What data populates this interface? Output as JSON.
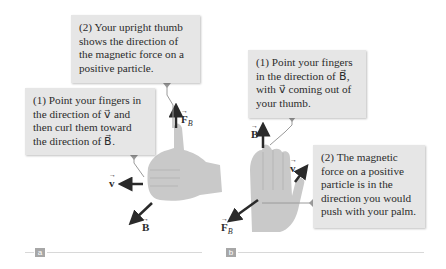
{
  "panel_a": {
    "label": "a",
    "callout_1": "(1) Point your fingers in\nthe direction of v⃗ and\nthen curl them toward\nthe direction of B⃗.",
    "callout_2": "(2) Your upright thumb\nshows the direction of\nthe magnetic force on a\npositive particle.",
    "vectors": {
      "v": "v",
      "B": "B",
      "F": "F",
      "F_sub": "B"
    }
  },
  "panel_b": {
    "label": "b",
    "callout_1": "(1) Point your fingers\nin the direction of B⃗,\nwith v⃗ coming out of\nyour thumb.",
    "callout_2": "(2) The magnetic\nforce on a positive\nparticle is in the\ndirection you would\npush with your palm.",
    "vectors": {
      "v": "v",
      "B": "B",
      "F": "F",
      "F_sub": "B"
    }
  },
  "colors": {
    "callout_bg": "#e6e6e6",
    "hand": "#c9c9c9",
    "arrow": "#2a2a2a",
    "leader": "#9a9a9a",
    "label_bg": "#a7a7a7"
  }
}
